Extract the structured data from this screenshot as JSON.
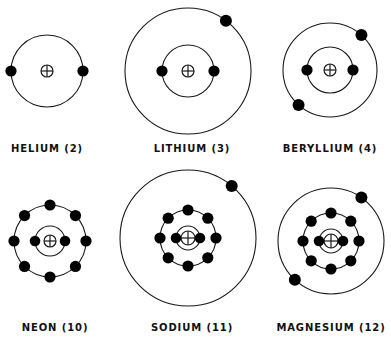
{
  "figure": {
    "background_color": "#ffffff",
    "stroke_color": "#1a1a1a",
    "electron_color": "#000000",
    "width": 391,
    "height": 352,
    "nucleus_symbol": "plus-in-circle"
  },
  "atoms": [
    {
      "id": "helium",
      "name": "HELIUM",
      "atomic_number": "2",
      "label": "HELIUM (2)",
      "label_x": 47,
      "label_y": 143,
      "nucleus": {
        "x": 47,
        "y": 71,
        "r": 6
      },
      "shells": [
        {
          "index": 1,
          "radius": 36,
          "electron_count": 2,
          "electron_angles": [
            180,
            0
          ]
        }
      ]
    },
    {
      "id": "lithium",
      "name": "LITHIUM",
      "atomic_number": "3",
      "label": "LITHIUM (3)",
      "label_x": 192,
      "label_y": 143,
      "nucleus": {
        "x": 188,
        "y": 71,
        "r": 6
      },
      "shells": [
        {
          "index": 1,
          "radius": 26,
          "electron_count": 2,
          "electron_angles": [
            180,
            0
          ]
        },
        {
          "index": 2,
          "radius": 63,
          "electron_count": 1,
          "electron_angles": [
            307
          ]
        }
      ]
    },
    {
      "id": "beryllium",
      "name": "BERYLLIUM",
      "atomic_number": "4",
      "label": "BERYLLIUM (4)",
      "label_x": 330,
      "label_y": 143,
      "nucleus": {
        "x": 330,
        "y": 70,
        "r": 6
      },
      "shells": [
        {
          "index": 1,
          "radius": 23,
          "electron_count": 2,
          "electron_angles": [
            180,
            0
          ]
        },
        {
          "index": 2,
          "radius": 47,
          "electron_count": 2,
          "electron_angles": [
            312,
            132
          ]
        }
      ]
    },
    {
      "id": "neon",
      "name": "NEON",
      "atomic_number": "10",
      "label": "NEON (10)",
      "label_x": 55,
      "label_y": 322,
      "nucleus": {
        "x": 50,
        "y": 241,
        "r": 6
      },
      "shells": [
        {
          "index": 1,
          "radius": 15,
          "electron_count": 2,
          "electron_angles": [
            180,
            0
          ]
        },
        {
          "index": 2,
          "radius": 36,
          "electron_count": 8,
          "electron_angles": [
            270,
            315,
            0,
            45,
            90,
            135,
            180,
            225
          ]
        }
      ]
    },
    {
      "id": "sodium",
      "name": "SODIUM",
      "atomic_number": "11",
      "label": "SODIUM (11)",
      "label_x": 192,
      "label_y": 322,
      "nucleus": {
        "x": 188,
        "y": 238,
        "r": 7
      },
      "shells": [
        {
          "index": 1,
          "radius": 12,
          "electron_count": 2,
          "electron_angles": [
            180,
            0
          ]
        },
        {
          "index": 2,
          "radius": 28,
          "electron_count": 8,
          "electron_angles": [
            270,
            315,
            0,
            45,
            90,
            135,
            180,
            225
          ]
        },
        {
          "index": 3,
          "radius": 68,
          "electron_count": 1,
          "electron_angles": [
            310
          ]
        }
      ]
    },
    {
      "id": "magnesium",
      "name": "MAGNESIUM",
      "atomic_number": "12",
      "label": "MAGNESIUM (12)",
      "label_x": 331,
      "label_y": 322,
      "nucleus": {
        "x": 331,
        "y": 241,
        "r": 7
      },
      "shells": [
        {
          "index": 1,
          "radius": 12,
          "electron_count": 2,
          "electron_angles": [
            180,
            0
          ]
        },
        {
          "index": 2,
          "radius": 28,
          "electron_count": 8,
          "electron_angles": [
            270,
            315,
            0,
            45,
            90,
            135,
            180,
            225
          ]
        },
        {
          "index": 3,
          "radius": 53,
          "electron_count": 2,
          "electron_angles": [
            305,
            133
          ]
        }
      ]
    }
  ]
}
